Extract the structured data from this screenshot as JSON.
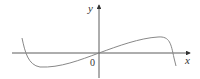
{
  "diagram": {
    "axes": {
      "x_label": "x",
      "y_label": "y",
      "origin_label": "0"
    },
    "colors": {
      "axis": "#333333",
      "curve": "#888888"
    }
  }
}
